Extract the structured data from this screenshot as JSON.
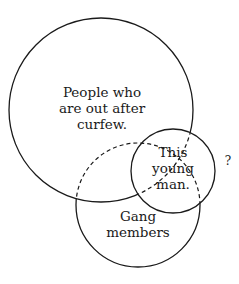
{
  "diagram": {
    "type": "venn",
    "sets": {
      "curfew": {
        "lines": [
          "People who",
          "are out after",
          "curfew."
        ]
      },
      "gang": {
        "lines": [
          "Gang",
          "members"
        ]
      },
      "young_man": {
        "lines": [
          "This",
          "young",
          "man."
        ]
      }
    },
    "annotation": "?",
    "colors": {
      "stroke": "#1a1a1a",
      "background": "#ffffff"
    }
  }
}
